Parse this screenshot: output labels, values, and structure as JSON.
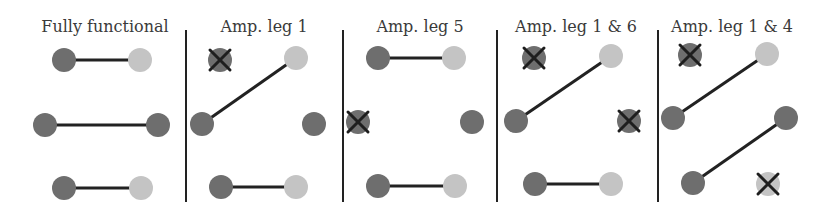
{
  "colors": {
    "dark_node": "#6e6e6e",
    "light_node": "#c4c4c4",
    "edge": "#222222",
    "divider": "#222222",
    "cross": "#1e1e1e"
  },
  "panels": [
    {
      "title": "Fully functional",
      "title_x": 105,
      "divider_x": 186,
      "nodes": [
        {
          "id": 1,
          "x": 64,
          "y": 60,
          "shade": "dark",
          "failed": false
        },
        {
          "id": 2,
          "x": 140,
          "y": 60,
          "shade": "light",
          "failed": false
        },
        {
          "id": 3,
          "x": 45,
          "y": 125,
          "shade": "dark",
          "failed": false
        },
        {
          "id": 4,
          "x": 158,
          "y": 125,
          "shade": "dark",
          "failed": false
        },
        {
          "id": 5,
          "x": 64,
          "y": 188,
          "shade": "dark",
          "failed": false
        },
        {
          "id": 6,
          "x": 141,
          "y": 188,
          "shade": "light",
          "failed": false
        }
      ],
      "edges": [
        [
          64,
          60,
          140,
          60
        ],
        [
          45,
          125,
          158,
          125
        ],
        [
          64,
          188,
          141,
          188
        ]
      ]
    },
    {
      "title": "Amp. leg 1",
      "title_x": 264,
      "divider_x": 343,
      "nodes": [
        {
          "id": 1,
          "x": 220,
          "y": 60,
          "shade": "dark",
          "failed": true
        },
        {
          "id": 2,
          "x": 296,
          "y": 58,
          "shade": "light",
          "failed": false
        },
        {
          "id": 3,
          "x": 202,
          "y": 124,
          "shade": "dark",
          "failed": false
        },
        {
          "id": 4,
          "x": 314,
          "y": 124,
          "shade": "dark",
          "failed": false
        },
        {
          "id": 5,
          "x": 221,
          "y": 187,
          "shade": "dark",
          "failed": false
        },
        {
          "id": 6,
          "x": 296,
          "y": 187,
          "shade": "light",
          "failed": false
        }
      ],
      "edges": [
        [
          202,
          124,
          296,
          58
        ],
        [
          221,
          187,
          296,
          187
        ]
      ]
    },
    {
      "title": "Amp. leg 5",
      "title_x": 420,
      "divider_x": 497,
      "nodes": [
        {
          "id": 1,
          "x": 378,
          "y": 58,
          "shade": "dark",
          "failed": false
        },
        {
          "id": 2,
          "x": 454,
          "y": 58,
          "shade": "light",
          "failed": false
        },
        {
          "id": 3,
          "x": 358,
          "y": 122,
          "shade": "dark",
          "failed": true
        },
        {
          "id": 4,
          "x": 472,
          "y": 122,
          "shade": "dark",
          "failed": false
        },
        {
          "id": 5,
          "x": 378,
          "y": 186,
          "shade": "dark",
          "failed": false
        },
        {
          "id": 6,
          "x": 455,
          "y": 186,
          "shade": "light",
          "failed": false
        }
      ],
      "edges": [
        [
          378,
          58,
          454,
          58
        ],
        [
          378,
          186,
          455,
          186
        ]
      ]
    },
    {
      "title": "Amp. leg 1 & 6",
      "title_x": 576,
      "divider_x": 658,
      "nodes": [
        {
          "id": 1,
          "x": 534,
          "y": 58,
          "shade": "dark",
          "failed": true
        },
        {
          "id": 2,
          "x": 611,
          "y": 56,
          "shade": "light",
          "failed": false
        },
        {
          "id": 3,
          "x": 516,
          "y": 121,
          "shade": "dark",
          "failed": false
        },
        {
          "id": 4,
          "x": 629,
          "y": 121,
          "shade": "dark",
          "failed": true
        },
        {
          "id": 5,
          "x": 535,
          "y": 184,
          "shade": "dark",
          "failed": false
        },
        {
          "id": 6,
          "x": 611,
          "y": 184,
          "shade": "light",
          "failed": false
        }
      ],
      "edges": [
        [
          516,
          121,
          611,
          56
        ],
        [
          535,
          184,
          611,
          184
        ]
      ]
    },
    {
      "title": "Amp. leg 1 & 4",
      "title_x": 732,
      "divider_x": null,
      "nodes": [
        {
          "id": 1,
          "x": 690,
          "y": 55,
          "shade": "dark",
          "failed": true
        },
        {
          "id": 2,
          "x": 767,
          "y": 54,
          "shade": "light",
          "failed": false
        },
        {
          "id": 3,
          "x": 673,
          "y": 118,
          "shade": "dark",
          "failed": false
        },
        {
          "id": 4,
          "x": 786,
          "y": 118,
          "shade": "dark",
          "failed": false
        },
        {
          "id": 5,
          "x": 693,
          "y": 183,
          "shade": "dark",
          "failed": false
        },
        {
          "id": 6,
          "x": 768,
          "y": 184,
          "shade": "light",
          "failed": true
        }
      ],
      "edges": [
        [
          673,
          118,
          767,
          54
        ],
        [
          693,
          183,
          786,
          118
        ]
      ]
    }
  ]
}
